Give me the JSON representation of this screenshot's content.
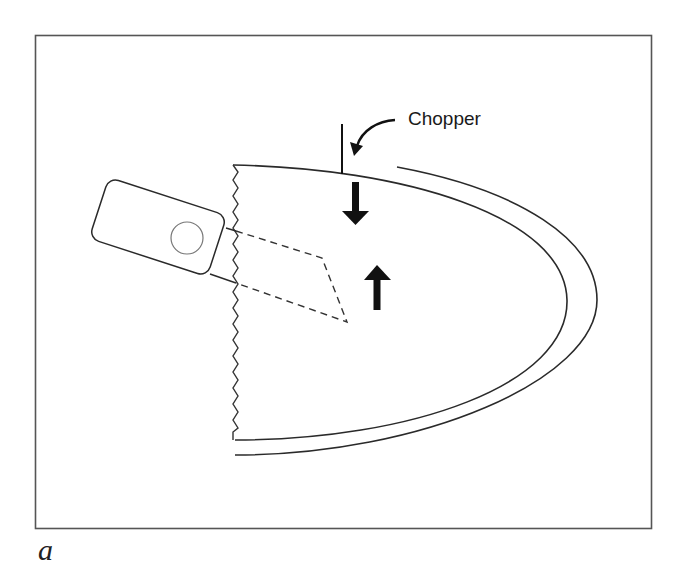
{
  "figure": {
    "panel_label": "a",
    "annotations": {
      "chopper_label": "Chopper"
    },
    "elements": {
      "frame": "rectangular border",
      "lens_shell": "nested curved capsule lines (inner and outer)",
      "incision_edge": "zigzag vertical cut edge",
      "handpiece": "rounded rectangle probe with circular port",
      "tip_path": "dashed outline of probe tip inside nucleus",
      "chopper_instrument": "vertical line with curved pointer arrow",
      "force_arrows": [
        "down-arrow",
        "up-arrow"
      ]
    },
    "colors": {
      "line": "#2a2a2a",
      "arrow_fill": "#111111",
      "circle": "#777777",
      "background": "#ffffff"
    }
  }
}
